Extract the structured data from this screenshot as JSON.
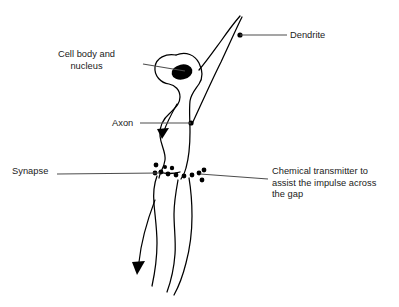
{
  "diagram": {
    "background_color": "#ffffff",
    "stroke_color": "#000000",
    "leader_color": "#4d4d4d",
    "labels": {
      "cell_body": "Cell body and\nnucleus",
      "axon": "Axon",
      "synapse": "Synapse",
      "dendrite": "Dendrite",
      "chemical_transmitter": "Chemical transmitter to\nassist the impulse across\nthe gap"
    },
    "parts": [
      {
        "name": "cell-body",
        "label": "Cell body and nucleus"
      },
      {
        "name": "nucleus",
        "label": "nucleus"
      },
      {
        "name": "axon",
        "label": "Axon"
      },
      {
        "name": "synapse",
        "label": "Synapse"
      },
      {
        "name": "dendrite",
        "label": "Dendrite"
      },
      {
        "name": "chemical-transmitter",
        "label": "Chemical transmitter to assist the impulse across the gap"
      }
    ],
    "vesicle_count": 12,
    "impulse_arrow_count": 2
  }
}
